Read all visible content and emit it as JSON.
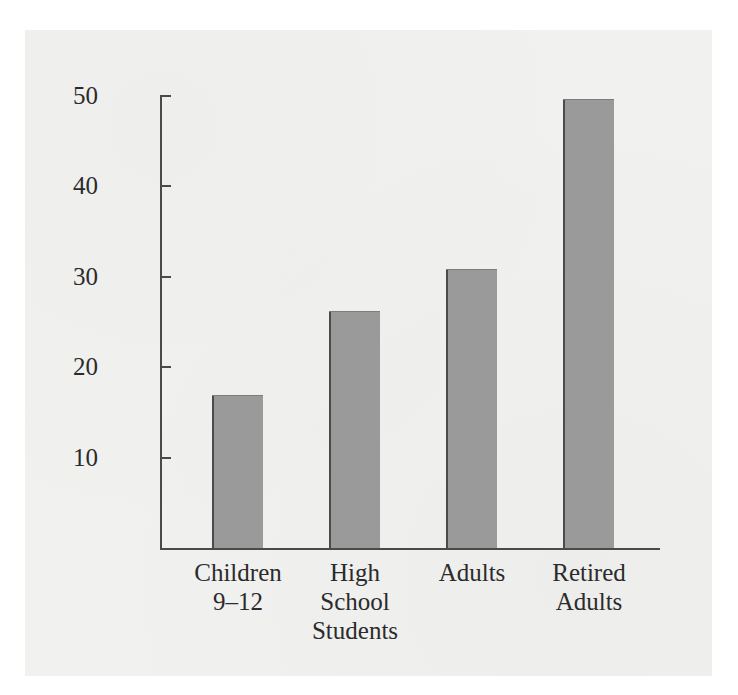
{
  "chart_data": {
    "type": "bar",
    "title": "",
    "subtitle": "",
    "xlabel": "",
    "ylabel": "Percentage of Day Spent Alone",
    "categories": [
      "Children 9–12",
      "High School Students",
      "Adults",
      "Retired Adults"
    ],
    "category_lines": [
      [
        "Children",
        "9–12"
      ],
      [
        "High",
        "School",
        "Students"
      ],
      [
        "Adults"
      ],
      [
        "Retired",
        "Adults"
      ]
    ],
    "values": [
      16.8,
      26.0,
      30.7,
      49.5
    ],
    "ylim": [
      0,
      50
    ],
    "yticks": [
      10,
      20,
      30,
      40,
      50
    ],
    "ytick_labels": [
      "10",
      "20",
      "30",
      "40",
      "50"
    ],
    "grid": false,
    "legend": false,
    "bar_color": "#9a9a9a",
    "bar_edge_color": "#4b4b4b",
    "axis_color": "#4a4a4a",
    "text_color": "#2b2b2b",
    "background_color": "#f1f1f0"
  },
  "axis": {
    "y_title": "Percentage of Day Spent Alone",
    "tick_50": "50",
    "tick_40": "40",
    "tick_30": "30",
    "tick_20": "20",
    "tick_10": "10"
  },
  "categories": {
    "c0_l0": "Children",
    "c0_l1": "9–12",
    "c1_l0": "High",
    "c1_l1": "School",
    "c1_l2": "Students",
    "c2_l0": "Adults",
    "c3_l0": "Retired",
    "c3_l1": "Adults"
  }
}
